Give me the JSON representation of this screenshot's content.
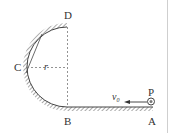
{
  "diagram": {
    "points": {
      "A": "A",
      "B": "B",
      "C": "C",
      "D": "D",
      "P": "P"
    },
    "radius_label": "r",
    "velocity_label": "v",
    "velocity_subscript": "0",
    "colors": {
      "line": "#444444",
      "dashed": "#777777",
      "border": "#cfcfcf"
    }
  }
}
